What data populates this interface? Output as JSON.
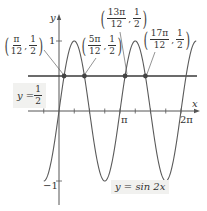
{
  "chart_data": {
    "type": "line",
    "title": "",
    "xlabel": "x",
    "ylabel": "y",
    "x_ticks": [
      {
        "value": "π",
        "position": 3.14159
      },
      {
        "value": "2π",
        "position": 6.28318
      }
    ],
    "y_ticks": [
      {
        "value": "1",
        "position": 1
      },
      {
        "value": "−1",
        "position": -1
      }
    ],
    "x_tick_step": "π/4",
    "xlim": [
      -0.785,
      7.07
    ],
    "ylim": [
      -1.3,
      1.35
    ],
    "grid": false,
    "series": [
      {
        "name": "y = sin 2x",
        "function": "sin(2x)",
        "color": "#555555",
        "x_range": [
          "-π/4",
          "9π/4"
        ]
      },
      {
        "name": "y = 1/2",
        "function": "0.5",
        "color": "#333333",
        "x_range": [
          "-5π/8",
          "9π/4"
        ]
      }
    ],
    "points": [
      {
        "label_num": "π",
        "label_den": "12",
        "y_num": "1",
        "y_den": "2",
        "x": 0.2618,
        "y": 0.5
      },
      {
        "label_num": "5π",
        "label_den": "12",
        "y_num": "1",
        "y_den": "2",
        "x": 1.309,
        "y": 0.5
      },
      {
        "label_num": "13π",
        "label_den": "12",
        "y_num": "1",
        "y_den": "2",
        "x": 3.4034,
        "y": 0.5
      },
      {
        "label_num": "17π",
        "label_den": "12",
        "y_num": "1",
        "y_den": "2",
        "x": 4.4506,
        "y": 0.5
      }
    ],
    "annotations": [
      {
        "text": "y = 1/2",
        "near": "horizontal line, left"
      },
      {
        "text": "y = sin 2x",
        "near": "bottom, between π and 2π"
      }
    ]
  },
  "labels": {
    "y_axis": "y",
    "x_axis": "x",
    "y_one": "1",
    "y_neg_one": "−1",
    "x_pi": "π",
    "x_two_pi": "2π",
    "line_label_prefix": "y = ",
    "line_label_num": "1",
    "line_label_den": "2",
    "curve_label": "y = sin 2x"
  },
  "colors": {
    "curve": "#555555",
    "line": "#3a3a3a",
    "axis": "#555555",
    "dot": "#444444",
    "label_bg": "#f1f1ef"
  }
}
